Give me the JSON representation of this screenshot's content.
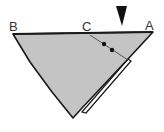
{
  "diagram": {
    "type": "folded-triangle",
    "labels": {
      "B": "B",
      "C": "C",
      "A": "A"
    },
    "marker": "down-arrow-icon",
    "dots": 2,
    "colors": {
      "fill": "#c4c4c4",
      "stroke": "#1a1a1a",
      "flap": "#ffffff",
      "label": "#333333"
    }
  }
}
